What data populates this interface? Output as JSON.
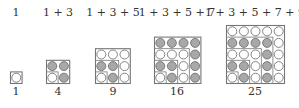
{
  "colors": {
    "filled": "#a8a8a8",
    "empty": "#ffffff",
    "stroke": "#666666",
    "box": "#777777"
  },
  "figures": [
    {
      "sum_label": "1",
      "square_label": "1",
      "n": 1,
      "left": 10,
      "bottom": 83,
      "label_x": 16
    },
    {
      "sum_label": "1 + 3",
      "square_label": "4",
      "n": 2,
      "left": 46,
      "bottom": 83,
      "label_x": 58
    },
    {
      "sum_label": "1 + 3 + 5",
      "square_label": "9",
      "n": 3,
      "left": 95,
      "bottom": 83,
      "label_x": 113
    },
    {
      "sum_label": "1 + 3 + 5 + 7",
      "square_label": "16",
      "n": 4,
      "left": 154,
      "bottom": 83,
      "label_x": 177
    },
    {
      "sum_label": "1 + 3 + 5 + 7 + 9",
      "square_label": "25",
      "n": 5,
      "left": 226,
      "bottom": 83,
      "label_x": 255
    }
  ],
  "cell_size": 11.6,
  "pattern_rule": "cell color by L-gnomon index from bottom-left: even index = empty, odd index = filled"
}
